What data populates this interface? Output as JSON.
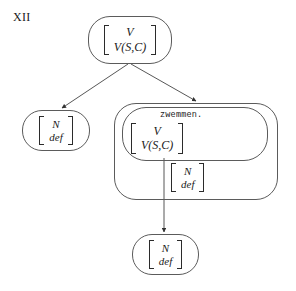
{
  "figure": {
    "label": "XII"
  },
  "nodes": {
    "top": {
      "name": "mother-node",
      "matrix": {
        "row1": "V",
        "row2": "V(S,C)"
      }
    },
    "left_daughter": {
      "name": "left-daughter-node",
      "matrix": {
        "row1": "N",
        "row2": "def"
      }
    },
    "outer_box": {
      "name": "verb-phrase-box",
      "inner_box": {
        "name": "lexical-verb-box",
        "lex_label": "zwemmen.",
        "matrix": {
          "row1": "V",
          "row2": "V(S,C)"
        }
      },
      "object_matrix": {
        "row1": "N",
        "row2": "def"
      }
    },
    "bottom": {
      "name": "bottom-node",
      "matrix": {
        "row1": "N",
        "row2": "def"
      }
    }
  },
  "edges": [
    {
      "id": "top-to-left",
      "from": "mother-node",
      "to": "left-daughter-node"
    },
    {
      "id": "top-to-box",
      "from": "mother-node",
      "to": "verb-phrase-box"
    },
    {
      "id": "verb-to-bottom",
      "from": "lexical-verb-box",
      "to": "bottom-node"
    }
  ],
  "style": {
    "node_stroke": "#5b5b5b",
    "edge_stroke": "#444444",
    "bracket_stroke": "#2b2b2b",
    "background": "#ffffff"
  }
}
